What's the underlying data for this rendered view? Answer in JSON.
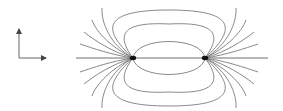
{
  "diagram": {
    "type": "electric-dipole-field-lines",
    "colors": {
      "background": "#ffffff",
      "field_line": "#7a7a7a",
      "axis_line": "#6e6e6e",
      "charge": "#111111",
      "arrow": "#555555"
    },
    "coordinate_arrows": {
      "origin": [
        19,
        58
      ],
      "vertical_tip": [
        19,
        27
      ],
      "horizontal_tip": [
        48,
        58
      ]
    },
    "axis": {
      "y": 58,
      "x_start": 76,
      "x_end": 268
    },
    "charges": [
      {
        "name": "left-charge",
        "x": 133,
        "y": 58
      },
      {
        "name": "right-charge",
        "x": 205,
        "y": 58
      }
    ],
    "closed_loops": [
      {
        "top_y": 40,
        "bottom_y": 76
      },
      {
        "top_y": 25,
        "bottom_y": 91
      },
      {
        "top_y": 10,
        "bottom_y": 106
      }
    ],
    "fan_lines_per_side": 5
  }
}
